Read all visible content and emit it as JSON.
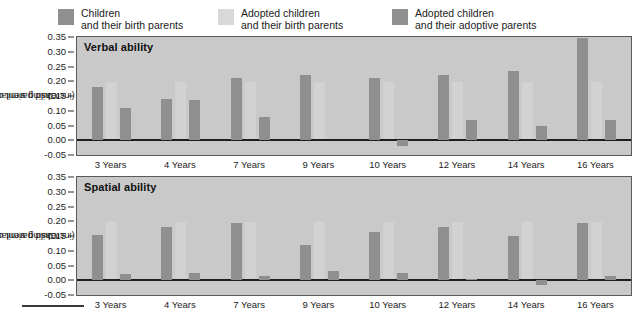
{
  "legend": {
    "items": [
      {
        "line1": "Children",
        "line2": "and their birth parents",
        "color": "#8f8f8f",
        "key": "children_birth"
      },
      {
        "line1": "Adopted children",
        "line2": "and their birth parents",
        "color": "#d9d9d9",
        "key": "adopted_birth"
      },
      {
        "line1": "Adopted children",
        "line2": "and their adoptive parents",
        "color": "#8f8f8f",
        "key": "adopted_adoptive"
      }
    ]
  },
  "axis": {
    "ylabel_line1": "Child parent correlation",
    "ylabel_line2": "(increasing similarity)",
    "yticks": [
      "0.35",
      "0.30",
      "0.25",
      "0.20",
      "0.15",
      "0.10",
      "0.05",
      "0.00",
      "-0.05"
    ],
    "ymin": -0.05,
    "ymax": 0.35,
    "xticks": [
      "3 Years",
      "4 Years",
      "7 Years",
      "9 Years",
      "10 Years",
      "12 Years",
      "14 Years",
      "16 Years"
    ]
  },
  "panels": {
    "top": {
      "title": "Verbal ability"
    },
    "bottom": {
      "title": "Spatial ability"
    }
  },
  "colors": {
    "plot_background": "#c9c9c9",
    "bar_dark": "#8f8f8f",
    "bar_light": "#d9d9d9",
    "axis_line": "#1e1e1e",
    "frame": "#5a5a5a",
    "text": "#1c1c1c"
  },
  "chart_data": [
    {
      "type": "bar",
      "title": "Verbal ability",
      "xlabel": "",
      "ylabel": "Child parent correlation (increasing similarity)",
      "ylim": [
        -0.05,
        0.35
      ],
      "yticks": [
        -0.05,
        0.0,
        0.05,
        0.1,
        0.15,
        0.2,
        0.25,
        0.3,
        0.35
      ],
      "grid": false,
      "legend_position": "above-figure",
      "categories": [
        "3 Years",
        "4 Years",
        "7 Years",
        "9 Years",
        "10 Years",
        "12 Years",
        "14 Years",
        "16 Years"
      ],
      "series": [
        {
          "name": "Children and their birth parents",
          "color": "#8f8f8f",
          "values": [
            0.18,
            0.14,
            0.21,
            0.22,
            0.21,
            0.22,
            0.235,
            0.345
          ]
        },
        {
          "name": "Adopted children and their birth parents",
          "color": "#d9d9d9",
          "values": [
            0.0,
            0.0,
            0.0,
            0.0,
            0.0,
            0.0,
            0.0,
            0.0
          ]
        },
        {
          "name": "Adopted children and their adoptive parents",
          "color": "#8f8f8f",
          "values": [
            0.11,
            0.135,
            0.08,
            0.0,
            -0.02,
            0.07,
            0.05,
            0.07
          ]
        }
      ]
    },
    {
      "type": "bar",
      "title": "Spatial ability",
      "xlabel": "",
      "ylabel": "Child parent correlation (increasing similarity)",
      "ylim": [
        -0.05,
        0.35
      ],
      "yticks": [
        -0.05,
        0.0,
        0.05,
        0.1,
        0.15,
        0.2,
        0.25,
        0.3,
        0.35
      ],
      "grid": false,
      "legend_position": "above-figure",
      "categories": [
        "3 Years",
        "4 Years",
        "7 Years",
        "9 Years",
        "10 Years",
        "12 Years",
        "14 Years",
        "16 Years"
      ],
      "series": [
        {
          "name": "Children and their birth parents",
          "color": "#8f8f8f",
          "values": [
            0.155,
            0.18,
            0.195,
            0.12,
            0.165,
            0.18,
            0.15,
            0.195
          ]
        },
        {
          "name": "Adopted children and their birth parents",
          "color": "#d9d9d9",
          "values": [
            0.0,
            0.0,
            0.0,
            0.0,
            0.0,
            0.0,
            0.0,
            0.0
          ]
        },
        {
          "name": "Adopted children and their adoptive parents",
          "color": "#8f8f8f",
          "values": [
            0.02,
            0.025,
            0.015,
            0.03,
            0.025,
            0.005,
            -0.015,
            0.015
          ]
        }
      ]
    }
  ]
}
